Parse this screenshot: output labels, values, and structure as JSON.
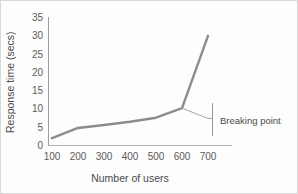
{
  "chart_data": {
    "type": "line",
    "title": "",
    "xlabel": "Number    of  users",
    "ylabel": "Response time (secs)",
    "x": [
      100,
      200,
      300,
      400,
      500,
      600,
      700
    ],
    "xtick_labels": [
      "100",
      "200",
      "300",
      "400",
      "500",
      "600",
      "700"
    ],
    "ytick_labels": [
      "0",
      "5",
      "10",
      "15",
      "20",
      "25",
      "30",
      "35"
    ],
    "yticks": [
      0,
      5,
      10,
      15,
      20,
      25,
      30,
      35
    ],
    "ylim": [
      0,
      35
    ],
    "xlim": [
      100,
      700
    ],
    "grid": false,
    "legend": "none",
    "series": [
      {
        "name": "Response time",
        "values": [
          2,
          4.8,
          5.6,
          6.5,
          7.6,
          10.2,
          30
        ]
      }
    ],
    "annotations": [
      {
        "name": "breaking-point",
        "label": "Breaking point",
        "at_x": 600,
        "at_y": 10.2,
        "leader_to_x": 700,
        "leader_to_y": 7.4
      }
    ]
  },
  "axis": {
    "y_title": "Response time (secs)",
    "x_title_parts": [
      "Number",
      "of",
      "users"
    ],
    "x_title": "Number    of  users"
  },
  "ticks": {
    "y": [
      "35",
      "30",
      "25",
      "20",
      "15",
      "10",
      "5",
      "0"
    ],
    "x": [
      "100",
      "200",
      "300",
      "400",
      "500",
      "600",
      "700"
    ]
  },
  "annotation": {
    "breaking_point_label": "Breaking point"
  },
  "colors": {
    "line": "#8c8c8c",
    "leader": "#9a9a9a",
    "axis": "#9e9e9e",
    "text": "#4a4a4a",
    "tick_text": "#5b5b5b",
    "background": "#fdfdfd",
    "frame": "#d8d8d8"
  }
}
